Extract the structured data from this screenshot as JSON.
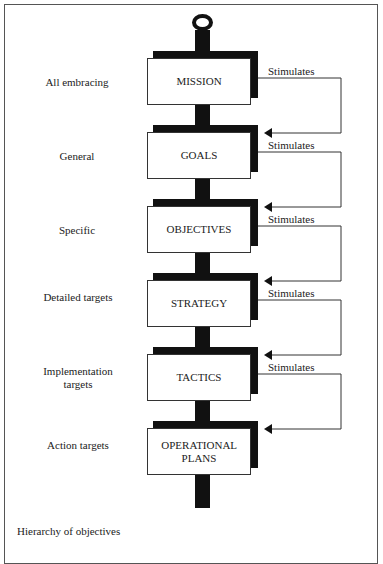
{
  "diagram": {
    "caption": "Hierarchy of objectives",
    "connector_label": "Stimulates",
    "levels": [
      {
        "box": "MISSION",
        "scope": "All embracing"
      },
      {
        "box": "GOALS",
        "scope": "General"
      },
      {
        "box": "OBJECTIVES",
        "scope": "Specific"
      },
      {
        "box": "STRATEGY",
        "scope": "Detailed targets"
      },
      {
        "box": "TACTICS",
        "scope": "Implementation targets"
      },
      {
        "box": "OPERATIONAL PLANS",
        "scope": "Action targets"
      }
    ],
    "arrows": [
      {
        "from": "MISSION",
        "to": "GOALS",
        "label": "Stimulates"
      },
      {
        "from": "GOALS",
        "to": "OBJECTIVES",
        "label": "Stimulates"
      },
      {
        "from": "OBJECTIVES",
        "to": "STRATEGY",
        "label": "Stimulates"
      },
      {
        "from": "STRATEGY",
        "to": "TACTICS",
        "label": "Stimulates"
      },
      {
        "from": "TACTICS",
        "to": "OPERATIONAL PLANS",
        "label": "Stimulates"
      }
    ]
  }
}
